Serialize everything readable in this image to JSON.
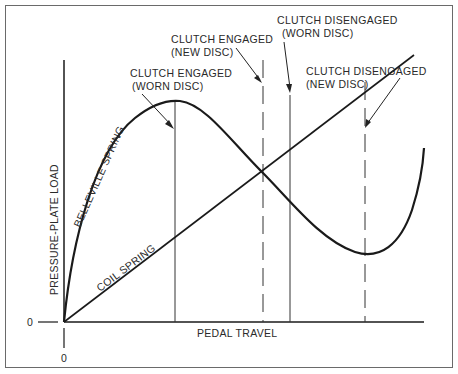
{
  "diagram": {
    "axes": {
      "y_label": "PRESSURE-PLATE LOAD",
      "x_label": "PEDAL TRAVEL",
      "y_zero": "0",
      "x_zero": "0"
    },
    "curves": {
      "belleville": "BELLEVILLE SPRING",
      "coil": "COIL SPRING"
    },
    "annotations": {
      "engaged_worn_line1": "CLUTCH ENGAGED",
      "engaged_worn_line2": "(WORN DISC)",
      "engaged_new_line1": "CLUTCH ENGAGED",
      "engaged_new_line2": "(NEW DISC)",
      "disengaged_worn_line1": "CLUTCH DISENGAGED",
      "disengaged_worn_line2": "(WORN DISC)",
      "disengaged_new_line1": "CLUTCH DISENGAGED",
      "disengaged_new_line2": "(NEW DISC)"
    },
    "colors": {
      "line": "#1a1a1a",
      "frame": "#6a6a6a",
      "text": "#2a2a2a"
    }
  }
}
